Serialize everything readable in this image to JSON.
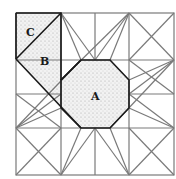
{
  "diagram": {
    "title": "",
    "labels": [
      {
        "text": "C",
        "x": 29,
        "y": 34
      },
      {
        "text": "B",
        "x": 45,
        "y": 64
      },
      {
        "text": "A",
        "x": 95,
        "y": 101
      }
    ],
    "grid": {
      "xs": [
        16,
        61,
        95,
        129,
        174
      ],
      "ys": [
        13,
        60,
        94,
        128,
        175
      ]
    },
    "colors": {
      "line": "#7a7a7a",
      "outline": "#1a1a1a",
      "fill": "#e6e6e6"
    }
  }
}
